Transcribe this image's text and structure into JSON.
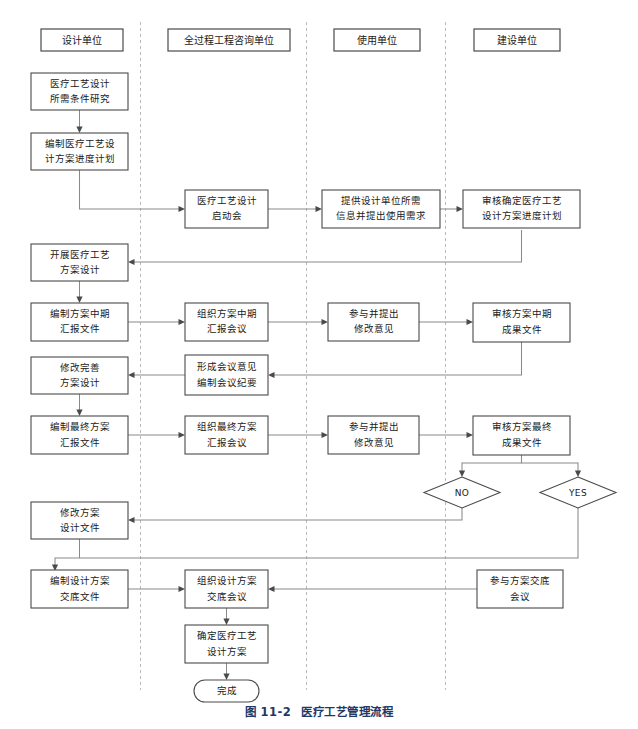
{
  "figure": {
    "caption_number": "图 11-2",
    "caption_title": "医疗工艺管理流程",
    "caption_color": "#1f3864"
  },
  "diagram": {
    "type": "swimlane-flowchart",
    "lane_headers": [
      {
        "id": "lane1",
        "label": "设计单位"
      },
      {
        "id": "lane2",
        "label": "全过程工程咨询单位"
      },
      {
        "id": "lane3",
        "label": "使用单位"
      },
      {
        "id": "lane4",
        "label": "建设单位"
      }
    ],
    "nodes": [
      {
        "id": "n1",
        "lane": 1,
        "shape": "rect",
        "lines": [
          "医疗工艺设计",
          "所需条件研究"
        ]
      },
      {
        "id": "n2",
        "lane": 1,
        "shape": "rect",
        "lines": [
          "编制医疗工艺设",
          "计方案进度计划"
        ]
      },
      {
        "id": "n3",
        "lane": 2,
        "shape": "rect",
        "lines": [
          "医疗工艺设计",
          "启动会"
        ]
      },
      {
        "id": "n4",
        "lane": 3,
        "shape": "rect",
        "lines": [
          "提供设计单位所需",
          "信息并提出使用需求"
        ]
      },
      {
        "id": "n5",
        "lane": 4,
        "shape": "rect",
        "lines": [
          "审核确定医疗工艺",
          "设计方案进度计划"
        ]
      },
      {
        "id": "n6",
        "lane": 1,
        "shape": "rect",
        "lines": [
          "开展医疗工艺",
          "方案设计"
        ]
      },
      {
        "id": "n7",
        "lane": 1,
        "shape": "rect",
        "lines": [
          "编制方案中期",
          "汇报文件"
        ]
      },
      {
        "id": "n8",
        "lane": 2,
        "shape": "rect",
        "lines": [
          "组织方案中期",
          "汇报会议"
        ]
      },
      {
        "id": "n9",
        "lane": 3,
        "shape": "rect",
        "lines": [
          "参与并提出",
          "修改意见"
        ]
      },
      {
        "id": "n10",
        "lane": 4,
        "shape": "rect",
        "lines": [
          "审核方案中期",
          "成果文件"
        ]
      },
      {
        "id": "n11",
        "lane": 1,
        "shape": "rect",
        "lines": [
          "修改完善",
          "方案设计"
        ]
      },
      {
        "id": "n12",
        "lane": 2,
        "shape": "rect",
        "lines": [
          "形成会议意见",
          "编制会议纪要"
        ]
      },
      {
        "id": "n13",
        "lane": 1,
        "shape": "rect",
        "lines": [
          "编制最终方案",
          "汇报文件"
        ]
      },
      {
        "id": "n14",
        "lane": 2,
        "shape": "rect",
        "lines": [
          "组织最终方案",
          "汇报会议"
        ]
      },
      {
        "id": "n15",
        "lane": 3,
        "shape": "rect",
        "lines": [
          "参与并提出",
          "修改意见"
        ]
      },
      {
        "id": "n16",
        "lane": 4,
        "shape": "rect",
        "lines": [
          "审核方案最终",
          "成果文件"
        ]
      },
      {
        "id": "d1",
        "lane": 4,
        "shape": "diamond",
        "lines": [
          "NO"
        ]
      },
      {
        "id": "d2",
        "lane": 4,
        "shape": "diamond",
        "lines": [
          "YES"
        ]
      },
      {
        "id": "n17",
        "lane": 1,
        "shape": "rect",
        "lines": [
          "修改方案",
          "设计文件"
        ]
      },
      {
        "id": "n18",
        "lane": 1,
        "shape": "rect",
        "lines": [
          "编制设计方案",
          "交底文件"
        ]
      },
      {
        "id": "n19",
        "lane": 2,
        "shape": "rect",
        "lines": [
          "组织设计方案",
          "交底会议"
        ]
      },
      {
        "id": "n20",
        "lane": 4,
        "shape": "rect",
        "lines": [
          "参与方案交底",
          "会议"
        ]
      },
      {
        "id": "n21",
        "lane": 2,
        "shape": "rect",
        "lines": [
          "确定医疗工艺",
          "设计方案"
        ]
      },
      {
        "id": "n22",
        "lane": 2,
        "shape": "terminal",
        "lines": [
          "完成"
        ]
      }
    ],
    "edges": [
      {
        "from": "n1",
        "to": "n2"
      },
      {
        "from": "n2",
        "to": "n3"
      },
      {
        "from": "n3",
        "to": "n4"
      },
      {
        "from": "n4",
        "to": "n5"
      },
      {
        "from": "n5",
        "to": "n6"
      },
      {
        "from": "n6",
        "to": "n7"
      },
      {
        "from": "n7",
        "to": "n8"
      },
      {
        "from": "n8",
        "to": "n9"
      },
      {
        "from": "n9",
        "to": "n10"
      },
      {
        "from": "n10",
        "to": "n12"
      },
      {
        "from": "n12",
        "to": "n11"
      },
      {
        "from": "n11",
        "to": "n13"
      },
      {
        "from": "n13",
        "to": "n14"
      },
      {
        "from": "n14",
        "to": "n15"
      },
      {
        "from": "n15",
        "to": "n16"
      },
      {
        "from": "n16",
        "to": "d1"
      },
      {
        "from": "n16",
        "to": "d2"
      },
      {
        "from": "d1",
        "to": "n17"
      },
      {
        "from": "d2",
        "to": "n18"
      },
      {
        "from": "n17",
        "to": "n18"
      },
      {
        "from": "n18",
        "to": "n19"
      },
      {
        "from": "n20",
        "to": "n19"
      },
      {
        "from": "n19",
        "to": "n21"
      },
      {
        "from": "n21",
        "to": "n22"
      }
    ]
  }
}
